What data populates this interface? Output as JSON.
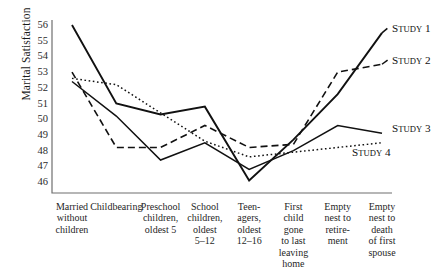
{
  "chart_data": {
    "type": "line",
    "title": "",
    "xlabel": "",
    "ylabel": "Marital Satisfaction",
    "ylim": [
      46,
      56
    ],
    "yticks": [
      56,
      55,
      54,
      53,
      52,
      51,
      50,
      49,
      48,
      47,
      46
    ],
    "grid": false,
    "legend": "inline-right-end-of-line",
    "categories": [
      "Married without children",
      "Childbearing",
      "Preschool children, oldest 5",
      "School children, oldest 5–12",
      "Teen-agers, oldest 12–16",
      "First child gone to last leaving home",
      "Empty nest to retirement",
      "Empty nest to death of first spouse"
    ],
    "category_lines": [
      [
        "Married",
        "without",
        "children"
      ],
      [
        "Childbearing"
      ],
      [
        "Preschool",
        "children,",
        "oldest 5"
      ],
      [
        "School",
        "children,",
        "oldest",
        "5–12"
      ],
      [
        "Teen-",
        "agers,",
        "oldest",
        "12–16"
      ],
      [
        "First",
        "child",
        "gone",
        "to last",
        "leaving",
        "home"
      ],
      [
        "Empty",
        "nest to",
        "retire-",
        "ment"
      ],
      [
        "Empty",
        "nest to",
        "death",
        "of first",
        "spouse"
      ]
    ],
    "series": [
      {
        "name": "Study 1",
        "label": "Study 1",
        "style": "solid",
        "width": 1.9,
        "color": "#111111",
        "values": [
          56.0,
          51.0,
          50.3,
          50.8,
          46.1,
          48.7,
          51.6,
          55.5
        ]
      },
      {
        "name": "Study 2",
        "label": "Study 2",
        "style": "dashed",
        "width": 1.6,
        "color": "#111111",
        "values": [
          53.0,
          48.2,
          48.2,
          49.6,
          48.2,
          48.4,
          53.0,
          53.5
        ]
      },
      {
        "name": "Study 3",
        "label": "Study 3",
        "style": "solid",
        "width": 1.5,
        "color": "#111111",
        "values": [
          52.4,
          50.2,
          47.4,
          48.5,
          46.8,
          48.0,
          49.6,
          49.1
        ]
      },
      {
        "name": "Study 4",
        "label": "Study 4",
        "style": "dotted",
        "width": 1.5,
        "color": "#111111",
        "values": [
          52.6,
          52.2,
          50.4,
          48.6,
          47.6,
          47.9,
          48.2,
          48.5
        ]
      }
    ]
  }
}
